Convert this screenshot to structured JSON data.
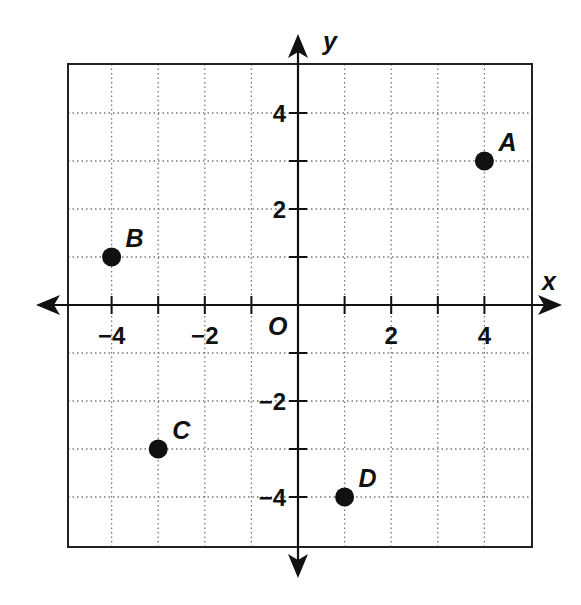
{
  "chart_data": {
    "type": "scatter",
    "title": "",
    "xlabel": "x",
    "ylabel": "y",
    "origin_label": "O",
    "xlim": [
      -5,
      5
    ],
    "ylim": [
      -5,
      5
    ],
    "grid": true,
    "grid_style": "dotted",
    "x_ticks": [
      -4,
      -3,
      -2,
      -1,
      1,
      2,
      3,
      4
    ],
    "y_ticks": [
      -4,
      -3,
      -2,
      -1,
      1,
      2,
      3,
      4
    ],
    "x_tick_labels": [
      {
        "value": -4,
        "label": "−4"
      },
      {
        "value": -2,
        "label": "−2"
      },
      {
        "value": 2,
        "label": "2"
      },
      {
        "value": 4,
        "label": "4"
      }
    ],
    "y_tick_labels": [
      {
        "value": 4,
        "label": "4"
      },
      {
        "value": 2,
        "label": "2"
      },
      {
        "value": -2,
        "label": "−2"
      },
      {
        "value": -4,
        "label": "−4"
      }
    ],
    "points": [
      {
        "label": "A",
        "x": 4,
        "y": 3
      },
      {
        "label": "B",
        "x": -4,
        "y": 1
      },
      {
        "label": "C",
        "x": -3,
        "y": -3
      },
      {
        "label": "D",
        "x": 1,
        "y": -4
      }
    ],
    "legend": null
  },
  "colors": {
    "ink": "#111111",
    "grid": "#777777",
    "background": "#ffffff"
  }
}
